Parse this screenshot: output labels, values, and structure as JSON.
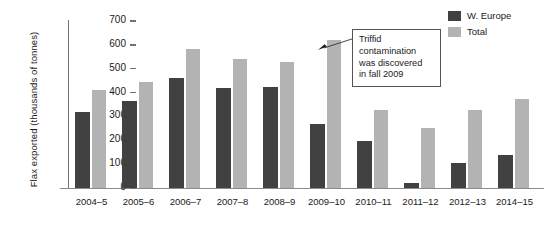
{
  "chart_data": {
    "type": "bar",
    "title": "",
    "xlabel": "",
    "ylabel": "Flax exported (thousands of tonnes)",
    "ylim": [
      0,
      700
    ],
    "yticks": [
      0,
      100,
      200,
      300,
      400,
      500,
      600,
      700
    ],
    "ytick_labels": [
      "0",
      "100",
      "200",
      "300",
      "400",
      "500",
      "600",
      "700"
    ],
    "grid": false,
    "legend_position": "top-right",
    "categories": [
      "2004–5",
      "2005–6",
      "2006–7",
      "2007–8",
      "2008–9",
      "2009–10",
      "2010–11",
      "2011–12",
      "2012–13",
      "2014–15"
    ],
    "series": [
      {
        "name": "W. Europe",
        "color": "#414141",
        "values": [
          320,
          363,
          462,
          420,
          425,
          270,
          198,
          20,
          105,
          140
        ]
      },
      {
        "name": "Total",
        "color": "#b3b3b3",
        "values": [
          412,
          445,
          583,
          540,
          530,
          620,
          328,
          253,
          325,
          375
        ]
      }
    ],
    "annotations": [
      {
        "text": "Triffid contamination was discovered in fall 2009",
        "lines": [
          "Triffid",
          "contamination",
          "was discovered",
          "in fall 2009"
        ],
        "points_to": {
          "category": "2009–10",
          "series": "Total",
          "value": 620
        }
      }
    ]
  },
  "legend": {
    "items": [
      {
        "label": "W. Europe",
        "color": "#414141"
      },
      {
        "label": "Total",
        "color": "#b3b3b3"
      }
    ]
  },
  "axes": {
    "y_title": "Flax exported (thousands of tonnes)"
  }
}
